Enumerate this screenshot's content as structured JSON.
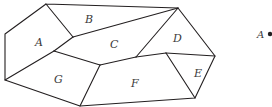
{
  "diagram": {
    "regions": [
      {
        "label": "A",
        "x": 38,
        "y": 44
      },
      {
        "label": "B",
        "x": 88,
        "y": 22
      },
      {
        "label": "C",
        "x": 113,
        "y": 47
      },
      {
        "label": "D",
        "x": 175,
        "y": 41
      },
      {
        "label": "E",
        "x": 197,
        "y": 76
      },
      {
        "label": "F",
        "x": 133,
        "y": 86
      },
      {
        "label": "G",
        "x": 57,
        "y": 82
      }
    ],
    "point": {
      "label": "A",
      "x": 259,
      "y": 39
    }
  }
}
